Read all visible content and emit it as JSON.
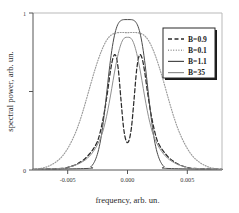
{
  "chart_data": {
    "type": "line",
    "title": "",
    "xlabel": "frequency, arb. un.",
    "ylabel": "spectral power, arb. un.",
    "xlim": [
      -0.0072,
      0.0072
    ],
    "ylim": [
      0,
      1
    ],
    "xticks": [
      -0.005,
      0.0,
      0.005
    ],
    "xticklabels": [
      "-0.005",
      "0.000",
      "0.005"
    ],
    "yticks": [
      0,
      0.5,
      1
    ],
    "yticklabels": [
      "0",
      "",
      "1"
    ],
    "grid": false,
    "legend_position": "upper-right",
    "series": [
      {
        "name": "B=0.9",
        "style": "dashed",
        "color": "#2b2b2b",
        "peak": 0.735,
        "center_dip": 0.175,
        "dip_center": 0.0,
        "peak_offsets": [
          -0.00125,
          0.00125
        ],
        "width": 0.0013,
        "x": [
          -0.005,
          -0.0045,
          -0.004,
          -0.0036,
          -0.0032,
          -0.0029,
          -0.0026,
          -0.0023,
          -0.0021,
          -0.0019,
          -0.0017,
          -0.0015,
          -0.0013,
          -0.0011,
          -0.0009,
          -0.0007,
          -0.0005,
          -0.0003,
          -0.0001,
          0.0001,
          0.0003,
          0.0005,
          0.0007,
          0.0009,
          0.0011,
          0.0013,
          0.0015,
          0.0017,
          0.0019,
          0.0021,
          0.0023,
          0.0026,
          0.0029,
          0.0032,
          0.0036,
          0.004,
          0.0045,
          0.005
        ],
        "y": [
          0.01,
          0.018,
          0.032,
          0.05,
          0.075,
          0.102,
          0.135,
          0.18,
          0.235,
          0.31,
          0.4,
          0.51,
          0.63,
          0.715,
          0.73,
          0.64,
          0.45,
          0.27,
          0.185,
          0.185,
          0.27,
          0.45,
          0.64,
          0.73,
          0.715,
          0.63,
          0.51,
          0.4,
          0.31,
          0.235,
          0.18,
          0.135,
          0.102,
          0.075,
          0.05,
          0.032,
          0.018,
          0.01
        ]
      },
      {
        "name": "B=0.1",
        "style": "dotted",
        "color": "#9a9a9a",
        "peak": 0.875,
        "width": 0.0028,
        "x": [
          -0.0065,
          -0.006,
          -0.0055,
          -0.005,
          -0.0045,
          -0.004,
          -0.0036,
          -0.0032,
          -0.0028,
          -0.0024,
          -0.002,
          -0.0016,
          -0.0012,
          -0.0008,
          -0.0004,
          0.0,
          0.0004,
          0.0008,
          0.0012,
          0.0016,
          0.002,
          0.0024,
          0.0028,
          0.0032,
          0.0036,
          0.004,
          0.0045,
          0.005,
          0.0055,
          0.006,
          0.0065
        ],
        "y": [
          0.012,
          0.025,
          0.048,
          0.085,
          0.145,
          0.23,
          0.32,
          0.43,
          0.548,
          0.66,
          0.755,
          0.825,
          0.862,
          0.874,
          0.876,
          0.875,
          0.876,
          0.874,
          0.862,
          0.825,
          0.755,
          0.66,
          0.548,
          0.43,
          0.32,
          0.23,
          0.145,
          0.085,
          0.048,
          0.025,
          0.012
        ]
      },
      {
        "name": "B=1.1",
        "style": "solid",
        "color": "#4a4a4a",
        "peak": 0.958,
        "width": 0.0015,
        "x": [
          -0.003,
          -0.0028,
          -0.0026,
          -0.0024,
          -0.0022,
          -0.002,
          -0.0018,
          -0.0016,
          -0.0014,
          -0.0012,
          -0.001,
          -0.0008,
          -0.0006,
          -0.0004,
          -0.0002,
          0.0,
          0.0002,
          0.0004,
          0.0006,
          0.0008,
          0.001,
          0.0012,
          0.0014,
          0.0016,
          0.0018,
          0.002,
          0.0022,
          0.0024,
          0.0026,
          0.0028,
          0.003
        ],
        "y": [
          0.01,
          0.02,
          0.04,
          0.075,
          0.13,
          0.215,
          0.335,
          0.48,
          0.63,
          0.76,
          0.855,
          0.915,
          0.945,
          0.956,
          0.958,
          0.958,
          0.958,
          0.956,
          0.945,
          0.915,
          0.855,
          0.76,
          0.63,
          0.48,
          0.335,
          0.215,
          0.13,
          0.075,
          0.04,
          0.02,
          0.01
        ]
      },
      {
        "name": "B=35",
        "style": "solid",
        "color": "#8f8f8f",
        "peak": 0.845,
        "width": 0.0016,
        "shoulder": 0.23,
        "x": [
          -0.005,
          -0.0045,
          -0.004,
          -0.0036,
          -0.0032,
          -0.0029,
          -0.0026,
          -0.0023,
          -0.002,
          -0.0018,
          -0.0016,
          -0.0014,
          -0.0012,
          -0.001,
          -0.0008,
          -0.0006,
          -0.0004,
          -0.0002,
          0.0,
          0.0002,
          0.0004,
          0.0006,
          0.0008,
          0.001,
          0.0012,
          0.0014,
          0.0016,
          0.0018,
          0.002,
          0.0023,
          0.0026,
          0.0029,
          0.0032,
          0.0036,
          0.004,
          0.0045,
          0.005
        ],
        "y": [
          0.01,
          0.018,
          0.03,
          0.045,
          0.065,
          0.088,
          0.118,
          0.16,
          0.215,
          0.27,
          0.34,
          0.425,
          0.52,
          0.618,
          0.705,
          0.775,
          0.822,
          0.843,
          0.845,
          0.843,
          0.822,
          0.775,
          0.705,
          0.618,
          0.52,
          0.425,
          0.34,
          0.27,
          0.215,
          0.16,
          0.118,
          0.088,
          0.065,
          0.045,
          0.03,
          0.018,
          0.01
        ]
      }
    ],
    "legend_entries": [
      {
        "label": "B=0.9",
        "style": "dashed",
        "color": "#2b2b2b"
      },
      {
        "label": "B=0.1",
        "style": "dotted",
        "color": "#9a9a9a"
      },
      {
        "label": "B=1.1",
        "style": "solid",
        "color": "#4a4a4a"
      },
      {
        "label": "B=35",
        "style": "solid",
        "color": "#8f8f8f"
      }
    ]
  }
}
